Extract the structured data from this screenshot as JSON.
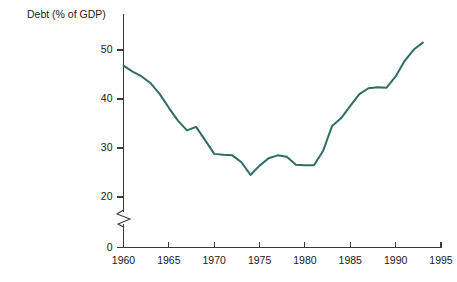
{
  "chart_data": {
    "type": "line",
    "title": "Debt (% of GDP)",
    "xlabel": "",
    "ylabel": "",
    "grid": false,
    "legend": "none",
    "axis_break": {
      "axis": "y",
      "between": [
        0,
        20
      ],
      "symbol": "zigzag"
    },
    "xlim": [
      1960,
      1995
    ],
    "ylim": [
      20,
      55
    ],
    "y_zero_tick": 0,
    "xticks": [
      1960,
      1965,
      1970,
      1975,
      1980,
      1985,
      1990,
      1995
    ],
    "xtick_labels": [
      "1960",
      "1965",
      "1970",
      "1975",
      "1980",
      "1985",
      "1990",
      "1995"
    ],
    "yticks": [
      0,
      20,
      30,
      40,
      50
    ],
    "ytick_labels": [
      "0",
      "20",
      "30",
      "40",
      "50"
    ],
    "series": [
      {
        "name": "Debt (% of GDP)",
        "color": "#2e6e63",
        "x": [
          1960,
          1961,
          1962,
          1963,
          1964,
          1965,
          1966,
          1967,
          1968,
          1969,
          1970,
          1971,
          1972,
          1973,
          1974,
          1975,
          1976,
          1977,
          1978,
          1979,
          1980,
          1981,
          1982,
          1983,
          1984,
          1985,
          1986,
          1987,
          1988,
          1989,
          1990,
          1991,
          1992,
          1993
        ],
        "values": [
          46.8,
          45.6,
          44.6,
          43.2,
          41.0,
          38.2,
          35.6,
          33.6,
          34.3,
          31.6,
          28.8,
          28.6,
          28.5,
          27.1,
          24.5,
          26.4,
          27.9,
          28.5,
          28.2,
          26.6,
          26.5,
          26.5,
          29.4,
          34.5,
          36.1,
          38.6,
          41.0,
          42.2,
          42.4,
          42.3,
          44.6,
          47.8,
          50.1,
          51.5
        ]
      }
    ]
  },
  "axis_titles": {
    "chart_title": "Debt (% of GDP)"
  }
}
